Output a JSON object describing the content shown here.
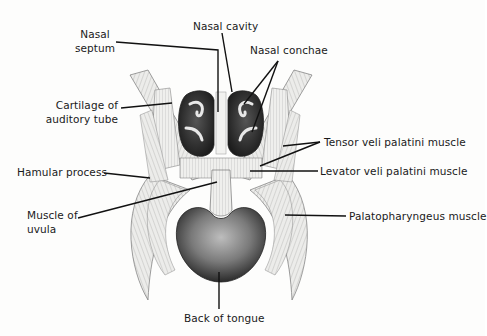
{
  "diagram": {
    "labels": {
      "nasal_cavity": "Nasal cavity",
      "nasal_septum_1": "Nasal",
      "nasal_septum_2": "septum",
      "nasal_conchae": "Nasal conchae",
      "cartilage_1": "Cartilage of",
      "cartilage_2": "auditory tube",
      "tensor": "Tensor veli palatini muscle",
      "levator": "Levator veli palatini muscle",
      "hamular": "Hamular process",
      "uvula_1": "Muscle of",
      "uvula_2": "uvula",
      "palatopharyngeus": "Palatopharyngeus muscle",
      "tongue": "Back of tongue"
    },
    "colors": {
      "ink": "#1a1a1a",
      "dark_fill": "#2b2b2b",
      "muscle_fill": "#e6e6e4",
      "muscle_stroke": "#6a6a6a",
      "tongue_fill": "#5a5a5a",
      "background": "#fdfdfc"
    }
  }
}
